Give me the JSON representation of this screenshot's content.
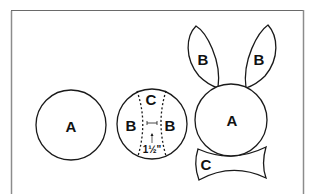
{
  "diagram": {
    "type": "craft-pattern",
    "colors": {
      "stroke": "#1a1a1a",
      "frame": "#8c8c8c",
      "background": "#ffffff"
    },
    "pieces": {
      "plate_whole": {
        "label": "A"
      },
      "plate_cut": {
        "labels": {
          "top": "C",
          "left": "B",
          "right": "B"
        },
        "measurement": "1½\""
      },
      "assembled": {
        "head": "A",
        "ear_left": "B",
        "ear_right": "B",
        "bowtie": "C"
      }
    }
  }
}
